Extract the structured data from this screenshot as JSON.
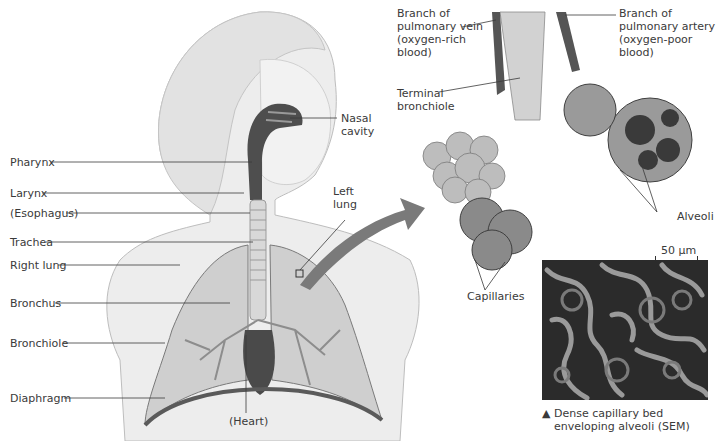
{
  "figure": {
    "top_cut_text": "",
    "labels_left": [
      {
        "id": "pharynx",
        "text": "Pharynx"
      },
      {
        "id": "larynx",
        "text": "Larynx"
      },
      {
        "id": "esophagus",
        "text": "(Esophagus)"
      },
      {
        "id": "trachea",
        "text": "Trachea"
      },
      {
        "id": "right-lung",
        "text": "Right lung"
      },
      {
        "id": "bronchus",
        "text": "Bronchus"
      },
      {
        "id": "bronchiole",
        "text": "Bronchiole"
      },
      {
        "id": "diaphragm",
        "text": "Diaphragm"
      }
    ],
    "labels_body": {
      "nasal_cavity": [
        "Nasal",
        "cavity"
      ],
      "left_lung": [
        "Left",
        "lung"
      ],
      "heart": "(Heart)"
    },
    "labels_detail": {
      "vein": [
        "Branch of",
        "pulmonary vein",
        "(oxygen-rich",
        "blood)"
      ],
      "artery": [
        "Branch of",
        "pulmonary artery",
        "(oxygen-poor",
        "blood)"
      ],
      "terminal_bronchiole": [
        "Terminal",
        "bronchiole"
      ],
      "alveoli": "Alveoli",
      "capillaries": "Capillaries",
      "scale": "50 µm"
    },
    "sem_caption": {
      "marker": "▲",
      "line1": "Dense capillary bed",
      "line2": "enveloping alveoli (SEM)"
    },
    "colors": {
      "body_fill": "#ececec",
      "body_stroke": "#b8b8b8",
      "lung_fill": "#c9c9c9",
      "dark_tissue": "#4a4a4a",
      "arrow": "#7a7a7a",
      "leader_line": "#3a3a3a"
    }
  }
}
